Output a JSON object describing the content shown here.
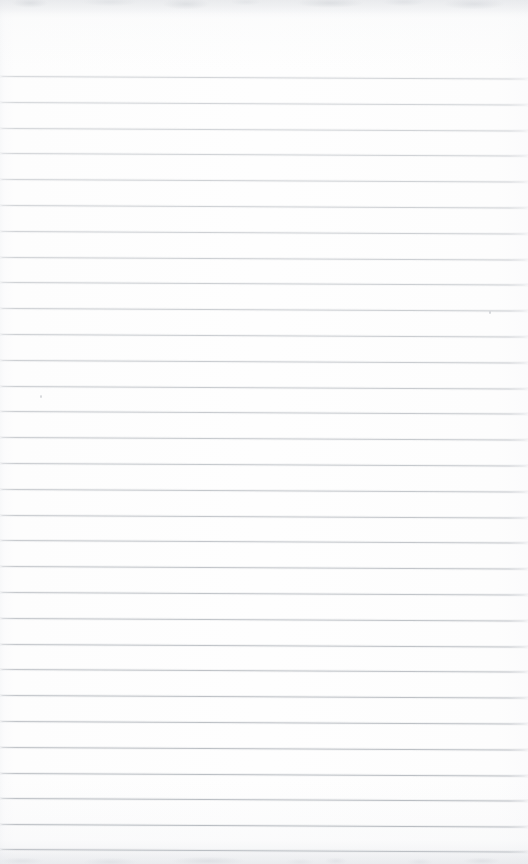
{
  "document": {
    "kind": "scanned-page",
    "title": "Blank Lined Notebook Page",
    "page_width": 528,
    "page_height": 864,
    "content_text": "",
    "handwriting_present": "no",
    "printed_text_present": "no"
  },
  "paper": {
    "background_color": "#fdfdfd",
    "edge_tint_color": "#f7f8f9",
    "description": "Near-white ruled notebook sheet, blank"
  },
  "ruling": {
    "line_color": "#b9bdc2",
    "line_thickness_px": 1,
    "line_spacing_px": 25.8,
    "first_line_y": 76,
    "last_line_y": 849,
    "line_count": 31,
    "skew_px_over_width": 2.5,
    "left_margin_rule": "none",
    "header_rule": "none",
    "line_y_positions": [
      76,
      101.8,
      127.6,
      153.4,
      179.2,
      205,
      230.8,
      256.6,
      282.4,
      308.2,
      334,
      359.8,
      385.6,
      411.4,
      437.2,
      463,
      488.8,
      514.6,
      540.4,
      566.2,
      592,
      617.8,
      643.6,
      669.4,
      695.2,
      721,
      746.8,
      772.6,
      798.4,
      824.2,
      849
    ]
  },
  "artifacts": {
    "top_edge_noise": "faint grey scanner smudges",
    "bottom_edge_noise": "faint grey scanner smudges",
    "dust_specks": [
      {
        "x": 40,
        "y": 395
      },
      {
        "x": 489,
        "y": 311
      }
    ]
  }
}
